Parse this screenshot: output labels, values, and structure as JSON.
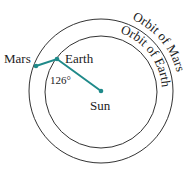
{
  "diagram": {
    "labels": {
      "mars": "Mars",
      "earth": "Earth",
      "sun": "Sun",
      "angle": "126°",
      "orbit_mars": "Orbit of Mars",
      "orbit_earth": "Orbit of Earth"
    },
    "colors": {
      "segment": "#1f8a8a",
      "orbit": "#333333"
    }
  }
}
